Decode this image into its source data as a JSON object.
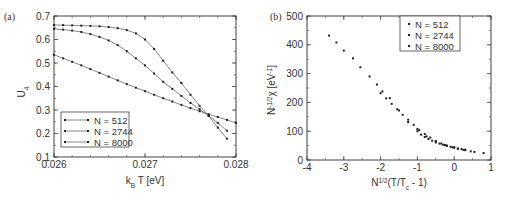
{
  "chart_data": [
    {
      "panel_label": "(a)",
      "type": "line",
      "title": "",
      "xlabel": "k_B T [eV]",
      "xlabel_main": "k",
      "xlabel_sub": "B",
      "xlabel_rest": " T [eV]",
      "ylabel": "U_4",
      "ylabel_main": "U",
      "ylabel_sub": "4",
      "xlim": [
        0.026,
        0.028
      ],
      "ylim": [
        0.1,
        0.7
      ],
      "xticks": [
        0.026,
        0.027,
        0.028
      ],
      "xtick_labels": [
        "0.026",
        "0.027",
        "0.028"
      ],
      "yticks": [
        0.1,
        0.2,
        0.3,
        0.4,
        0.5,
        0.6,
        0.7
      ],
      "ytick_labels": [
        "0.1",
        "0.2",
        "0.3",
        "0.4",
        "0.5",
        "0.6",
        "0.7"
      ],
      "grid": false,
      "legend_position": "lower left",
      "series": [
        {
          "name": "N = 512",
          "x": [
            0.026,
            0.0261,
            0.0262,
            0.0263,
            0.0264,
            0.0265,
            0.0266,
            0.0267,
            0.0268,
            0.0269,
            0.027,
            0.0271,
            0.0272,
            0.0273,
            0.0274,
            0.0275,
            0.0276,
            0.0277,
            0.0278,
            0.0279,
            0.028
          ],
          "y": [
            0.535,
            0.52,
            0.505,
            0.49,
            0.474,
            0.458,
            0.442,
            0.426,
            0.41,
            0.395,
            0.38,
            0.365,
            0.35,
            0.336,
            0.322,
            0.308,
            0.295,
            0.282,
            0.27,
            0.258,
            0.245
          ]
        },
        {
          "name": "N = 2744",
          "x": [
            0.026,
            0.0261,
            0.0262,
            0.0263,
            0.0264,
            0.0265,
            0.0266,
            0.0267,
            0.0268,
            0.0269,
            0.027,
            0.0271,
            0.0272,
            0.0273,
            0.0274,
            0.0275,
            0.0276,
            0.0277,
            0.0278,
            0.0279
          ],
          "y": [
            0.645,
            0.642,
            0.638,
            0.632,
            0.623,
            0.611,
            0.596,
            0.576,
            0.55,
            0.52,
            0.49,
            0.455,
            0.42,
            0.39,
            0.36,
            0.33,
            0.303,
            0.275,
            0.245,
            0.212
          ]
        },
        {
          "name": "N = 8000",
          "x": [
            0.026,
            0.0261,
            0.0262,
            0.0263,
            0.0264,
            0.0265,
            0.0266,
            0.0267,
            0.0268,
            0.0269,
            0.027,
            0.0271,
            0.0272,
            0.0273,
            0.0274,
            0.0275,
            0.0276,
            0.0277,
            0.0278,
            0.0279
          ],
          "y": [
            0.662,
            0.661,
            0.66,
            0.659,
            0.658,
            0.656,
            0.653,
            0.648,
            0.64,
            0.626,
            0.6,
            0.56,
            0.51,
            0.46,
            0.415,
            0.365,
            0.318,
            0.275,
            0.225,
            0.178
          ]
        }
      ],
      "legend": [
        "N = 512",
        "N = 2744",
        "N = 8000"
      ]
    },
    {
      "panel_label": "(b)",
      "type": "scatter",
      "title": "",
      "xlabel": "N^{1/2}(T/T_c - 1)",
      "xlabel_main_1": "N",
      "xlabel_sup": "1/2",
      "xlabel_main_2": "(T/T",
      "xlabel_sub": "c",
      "xlabel_main_3": " - 1)",
      "ylabel": "N^{-1/2} χ [eV^{-1}]",
      "ylabel_main_1": "N",
      "ylabel_sup_1": "-1/2",
      "ylabel_main_2": "χ [eV",
      "ylabel_sup_2": "-1",
      "ylabel_main_3": "]",
      "xlim": [
        -4,
        1
      ],
      "ylim": [
        0,
        500
      ],
      "xticks": [
        -4,
        -3,
        -2,
        -1,
        0,
        1
      ],
      "xtick_labels": [
        "-4",
        "-3",
        "-2",
        "-1",
        "0",
        "1"
      ],
      "yticks": [
        0,
        100,
        200,
        300,
        400,
        500
      ],
      "ytick_labels": [
        "0",
        "100",
        "200",
        "300",
        "400",
        "500"
      ],
      "grid": false,
      "legend_position": "upper right",
      "series": [
        {
          "name": "N = 512",
          "x": [
            -1.0,
            -0.9,
            -0.8,
            -0.7,
            -0.6,
            -0.5,
            -0.4,
            -0.3,
            -0.2,
            -0.1,
            0.0,
            0.1,
            0.2,
            0.3
          ],
          "y": [
            100,
            88,
            80,
            73,
            67,
            61,
            57,
            53,
            49,
            46,
            43,
            40,
            38,
            36
          ]
        },
        {
          "name": "N = 2744",
          "x": [
            -2.0,
            -1.85,
            -1.7,
            -1.55,
            -1.4,
            -1.25,
            -1.1,
            -0.95,
            -0.8,
            -0.65,
            -0.5,
            -0.35,
            -0.2,
            -0.05,
            0.1,
            0.25,
            0.45,
            0.55
          ],
          "y": [
            232,
            214,
            195,
            176,
            157,
            140,
            122,
            104,
            90,
            78,
            66,
            57,
            50,
            44,
            39,
            35,
            30,
            28
          ]
        },
        {
          "name": "N = 8000",
          "x": [
            -3.4,
            -3.2,
            -3.0,
            -2.75,
            -2.55,
            -2.3,
            -2.1,
            -1.95,
            -1.75,
            -1.5,
            -1.25,
            -1.0,
            -0.75,
            -0.5,
            -0.25,
            0.0,
            0.3,
            0.8
          ],
          "y": [
            432,
            408,
            380,
            353,
            322,
            290,
            262,
            238,
            215,
            172,
            132,
            108,
            82,
            64,
            52,
            44,
            34,
            24
          ]
        }
      ],
      "legend": [
        "N = 512",
        "N = 2744",
        "N = 8000"
      ]
    }
  ]
}
